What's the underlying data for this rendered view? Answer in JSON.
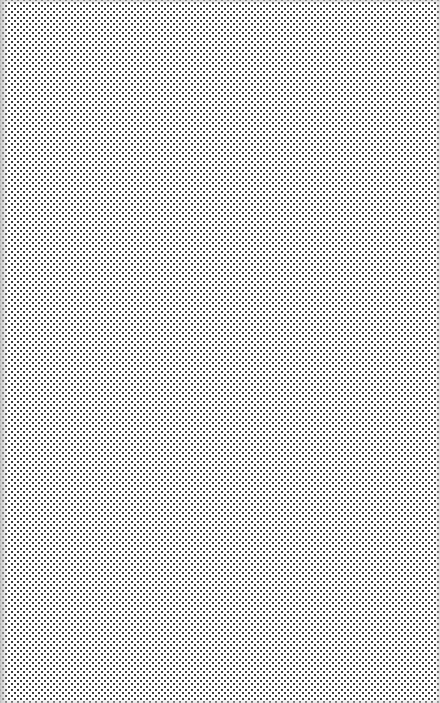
{
  "canvas": {
    "pattern": "staggered-dot-grid",
    "dot_color": "#3a3a3a",
    "background_color": "#ffffff",
    "dot_pitch_px": 6,
    "edge_fade_color": "#bebebe"
  }
}
